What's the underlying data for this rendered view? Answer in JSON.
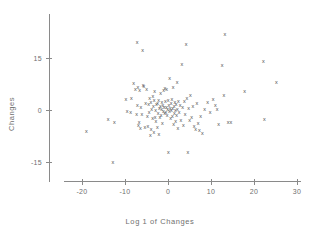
{
  "chart_data": {
    "type": "scatter",
    "title": "",
    "xlabel": "Log 1 of Changes",
    "ylabel": "Changes",
    "marker": "x",
    "marker_color": "#4a4a4a",
    "axis_color": "#8a8a8a",
    "grid": false,
    "legend": null,
    "xlim": [
      -26,
      31
    ],
    "ylim": [
      -22,
      22
    ],
    "xticks": [
      -20,
      -10,
      0,
      10,
      20,
      30
    ],
    "xticklabels": [
      "-20",
      "-10",
      "0",
      "10",
      "20",
      "30"
    ],
    "yticks": [
      15,
      0,
      -15
    ],
    "yticklabels": [
      "15",
      "0",
      "-15"
    ],
    "n_points": 126,
    "points": [
      [
        -19.0,
        -6.1
      ],
      [
        -13.9,
        -2.6
      ],
      [
        -12.8,
        -15.0
      ],
      [
        -12.5,
        -3.6
      ],
      [
        -9.8,
        3.3
      ],
      [
        -9.5,
        -0.3
      ],
      [
        -8.7,
        -0.6
      ],
      [
        -8.5,
        3.6
      ],
      [
        -8.0,
        7.8
      ],
      [
        -7.6,
        6.2
      ],
      [
        -7.3,
        -1.1
      ],
      [
        -7.2,
        19.6
      ],
      [
        -7.1,
        1.3
      ],
      [
        -7.0,
        6.6
      ],
      [
        -6.9,
        -4.2
      ],
      [
        -6.7,
        -3.4
      ],
      [
        -6.6,
        5.9
      ],
      [
        -6.4,
        -5.3
      ],
      [
        -6.3,
        0.9
      ],
      [
        -6.1,
        -1.2
      ],
      [
        -5.9,
        17.4
      ],
      [
        -5.8,
        7.2
      ],
      [
        -5.6,
        6.9
      ],
      [
        -5.4,
        -4.9
      ],
      [
        -5.2,
        2.1
      ],
      [
        -5.0,
        6.0
      ],
      [
        -4.8,
        -1.6
      ],
      [
        -4.7,
        -4.5
      ],
      [
        -4.5,
        1.6
      ],
      [
        -4.4,
        -0.5
      ],
      [
        -4.3,
        3.5
      ],
      [
        -4.1,
        -7.2
      ],
      [
        -4.0,
        2.4
      ],
      [
        -3.9,
        -5.6
      ],
      [
        -3.8,
        0.3
      ],
      [
        -3.6,
        -2.4
      ],
      [
        -3.5,
        4.1
      ],
      [
        -3.4,
        1.1
      ],
      [
        -3.3,
        -6.4
      ],
      [
        -3.2,
        2.8
      ],
      [
        -3.1,
        5.4
      ],
      [
        -3.0,
        -1.9
      ],
      [
        -2.9,
        0.1
      ],
      [
        -2.8,
        -3.1
      ],
      [
        -2.7,
        1.8
      ],
      [
        -2.5,
        -5.0
      ],
      [
        -2.4,
        2.0
      ],
      [
        -2.3,
        -0.9
      ],
      [
        -2.2,
        3.0
      ],
      [
        -2.1,
        -6.9
      ],
      [
        -2.0,
        0.6
      ],
      [
        -1.9,
        -2.0
      ],
      [
        -1.8,
        1.2
      ],
      [
        -1.7,
        4.9
      ],
      [
        -1.6,
        -1.4
      ],
      [
        -1.5,
        0.4
      ],
      [
        -1.4,
        2.3
      ],
      [
        -1.3,
        -3.8
      ],
      [
        -1.2,
        1.5
      ],
      [
        -1.1,
        -0.2
      ],
      [
        -1.0,
        5.7
      ],
      [
        -0.9,
        0.8
      ],
      [
        -0.8,
        -1.0
      ],
      [
        -0.7,
        6.3
      ],
      [
        -0.6,
        2.6
      ],
      [
        -0.5,
        -0.7
      ],
      [
        -0.4,
        1.0
      ],
      [
        -0.3,
        6.1
      ],
      [
        -0.2,
        -1.3
      ],
      [
        -0.1,
        0.2
      ],
      [
        0.0,
        2.9
      ],
      [
        0.1,
        -12.2
      ],
      [
        0.2,
        1.4
      ],
      [
        0.3,
        -0.4
      ],
      [
        0.4,
        9.3
      ],
      [
        0.5,
        0.7
      ],
      [
        0.6,
        -2.2
      ],
      [
        0.7,
        1.9
      ],
      [
        0.8,
        -0.1
      ],
      [
        0.9,
        3.2
      ],
      [
        1.0,
        -1.7
      ],
      [
        1.1,
        0.5
      ],
      [
        1.2,
        6.5
      ],
      [
        1.3,
        -4.0
      ],
      [
        1.4,
        1.1
      ],
      [
        1.5,
        -0.8
      ],
      [
        1.6,
        2.2
      ],
      [
        1.7,
        0.0
      ],
      [
        1.8,
        -3.3
      ],
      [
        1.9,
        1.7
      ],
      [
        2.0,
        -1.5
      ],
      [
        2.1,
        8.1
      ],
      [
        2.2,
        0.3
      ],
      [
        2.3,
        -5.2
      ],
      [
        2.4,
        2.5
      ],
      [
        2.6,
        -0.6
      ],
      [
        2.8,
        1.3
      ],
      [
        3.0,
        -2.8
      ],
      [
        3.2,
        13.3
      ],
      [
        3.4,
        0.9
      ],
      [
        3.6,
        -4.3
      ],
      [
        3.8,
        2.7
      ],
      [
        4.0,
        -1.1
      ],
      [
        4.2,
        19.1
      ],
      [
        4.4,
        3.4
      ],
      [
        4.6,
        -12.1
      ],
      [
        4.8,
        0.6
      ],
      [
        5.0,
        -3.0
      ],
      [
        5.2,
        4.4
      ],
      [
        5.5,
        -2.1
      ],
      [
        5.8,
        1.2
      ],
      [
        6.1,
        -4.6
      ],
      [
        6.4,
        -5.4
      ],
      [
        6.7,
        2.0
      ],
      [
        7.0,
        -3.7
      ],
      [
        7.3,
        -5.9
      ],
      [
        7.6,
        -1.8
      ],
      [
        8.0,
        -6.7
      ],
      [
        8.5,
        0.4
      ],
      [
        9.2,
        2.3
      ],
      [
        9.8,
        -0.5
      ],
      [
        10.5,
        3.1
      ],
      [
        11.0,
        1.5
      ],
      [
        11.4,
        0.2
      ],
      [
        11.8,
        -3.9
      ],
      [
        12.6,
        13.0
      ],
      [
        13.0,
        4.2
      ],
      [
        13.2,
        22.0
      ],
      [
        14.0,
        -3.5
      ],
      [
        14.6,
        -3.6
      ],
      [
        17.8,
        5.5
      ],
      [
        22.2,
        14.0
      ],
      [
        22.4,
        -2.7
      ],
      [
        25.2,
        8.0
      ]
    ]
  }
}
